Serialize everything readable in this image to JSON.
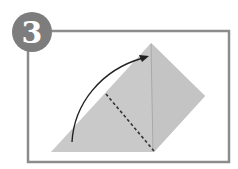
{
  "step": {
    "number": "3"
  },
  "colors": {
    "badge": "#7d7d7d",
    "badge_text": "#ffffff",
    "frame": "#8c8c8c",
    "paper": "#c9c9c9",
    "paper_dark": "#bcbcbc",
    "crease": "#a8a8a8",
    "arrow": "#222222",
    "dashed": "#333333",
    "background": "#ffffff"
  },
  "diagram": {
    "elements": [
      {
        "type": "folded-paper-shape",
        "label": "paper"
      },
      {
        "type": "valley-fold-line",
        "label": "dashed fold line"
      },
      {
        "type": "fold-arrow",
        "label": "curved arrow pointing up to apex"
      }
    ]
  }
}
